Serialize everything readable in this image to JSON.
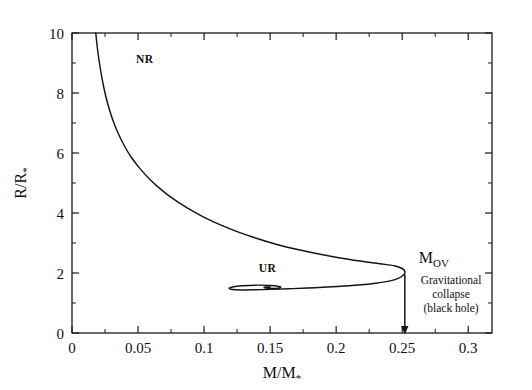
{
  "figure": {
    "background_color": "#ffffff",
    "ink_color": "#141414"
  },
  "axes": {
    "x": {
      "label_main": "M/M",
      "label_sub": "*",
      "min": 0,
      "max": 0.318,
      "tick_labels": [
        "0",
        "0.05",
        "0.1",
        "0.15",
        "0.2",
        "0.25",
        "0.3"
      ],
      "tick_values": [
        0,
        0.05,
        0.1,
        0.15,
        0.2,
        0.25,
        0.3
      ],
      "minor_tick_values": [
        0.025,
        0.075,
        0.125,
        0.175,
        0.225,
        0.275
      ]
    },
    "y": {
      "label_main": "R/R",
      "label_sub": "*",
      "min": 0,
      "max": 10,
      "tick_labels": [
        "0",
        "2",
        "4",
        "6",
        "8",
        "10"
      ],
      "tick_values": [
        0,
        2,
        4,
        6,
        8,
        10
      ],
      "minor_tick_values": [
        1,
        3,
        5,
        7,
        9
      ]
    }
  },
  "annotations": {
    "nr_label": "NR",
    "ur_label": "UR",
    "mov_label_main": "M",
    "mov_label_sub": "OV",
    "collapse_line1": "Gravitational",
    "collapse_line2": "collapse",
    "collapse_line3": "(black hole)",
    "arrow_name": "down-arrow"
  },
  "chart_data": {
    "type": "line",
    "title": "",
    "xlabel": "M/M*",
    "ylabel": "R/R*",
    "xlim": [
      0,
      0.318
    ],
    "ylim": [
      0,
      10
    ],
    "grid": false,
    "legend": "none",
    "axis_ticks_inward": true,
    "series": [
      {
        "name": "mass-radius sequence",
        "comment": "Single continuous branch: NR branch descends from top-left, turns at M_OV, returns leftward and spirals into the UR limit point.",
        "points": [
          [
            0.018,
            10.0
          ],
          [
            0.0195,
            9.4
          ],
          [
            0.0215,
            8.8
          ],
          [
            0.024,
            8.2
          ],
          [
            0.027,
            7.65
          ],
          [
            0.0305,
            7.15
          ],
          [
            0.0345,
            6.7
          ],
          [
            0.0395,
            6.25
          ],
          [
            0.045,
            5.85
          ],
          [
            0.0515,
            5.48
          ],
          [
            0.059,
            5.12
          ],
          [
            0.0675,
            4.78
          ],
          [
            0.077,
            4.46
          ],
          [
            0.0875,
            4.16
          ],
          [
            0.099,
            3.88
          ],
          [
            0.1115,
            3.62
          ],
          [
            0.125,
            3.38
          ],
          [
            0.1395,
            3.16
          ],
          [
            0.1545,
            2.96
          ],
          [
            0.17,
            2.79
          ],
          [
            0.186,
            2.64
          ],
          [
            0.202,
            2.51
          ],
          [
            0.218,
            2.4
          ],
          [
            0.233,
            2.31
          ],
          [
            0.244,
            2.24
          ],
          [
            0.25,
            2.15
          ],
          [
            0.252,
            2.05
          ],
          [
            0.251,
            1.93
          ],
          [
            0.247,
            1.82
          ],
          [
            0.24,
            1.73
          ],
          [
            0.23,
            1.66
          ],
          [
            0.217,
            1.6
          ],
          [
            0.201,
            1.55
          ],
          [
            0.184,
            1.51
          ],
          [
            0.167,
            1.48
          ],
          [
            0.151,
            1.455
          ],
          [
            0.138,
            1.44
          ],
          [
            0.128,
            1.435
          ],
          [
            0.1215,
            1.45
          ],
          [
            0.119,
            1.485
          ],
          [
            0.1215,
            1.535
          ],
          [
            0.129,
            1.575
          ],
          [
            0.14,
            1.595
          ],
          [
            0.15,
            1.585
          ],
          [
            0.1565,
            1.555
          ],
          [
            0.158,
            1.52
          ],
          [
            0.1555,
            1.495
          ],
          [
            0.1505,
            1.487
          ],
          [
            0.1465,
            1.5
          ],
          [
            0.1455,
            1.52
          ],
          [
            0.1475,
            1.533
          ],
          [
            0.15,
            1.528
          ]
        ]
      }
    ],
    "key_points": [
      {
        "name": "M_OV",
        "label": "M_OV",
        "x": 0.251,
        "y": 2.12,
        "note": "maximum mass (Oppenheimer-Volkoff limit)"
      },
      {
        "name": "NR branch",
        "label": "NR",
        "x": 0.055,
        "y": 9.0
      },
      {
        "name": "UR limit",
        "label": "UR",
        "x": 0.148,
        "y": 2.05
      }
    ],
    "arrow": {
      "x": 0.252,
      "y_start": 1.95,
      "y_end": 0.0,
      "direction": "down",
      "label": "Gravitational collapse (black hole)"
    }
  }
}
